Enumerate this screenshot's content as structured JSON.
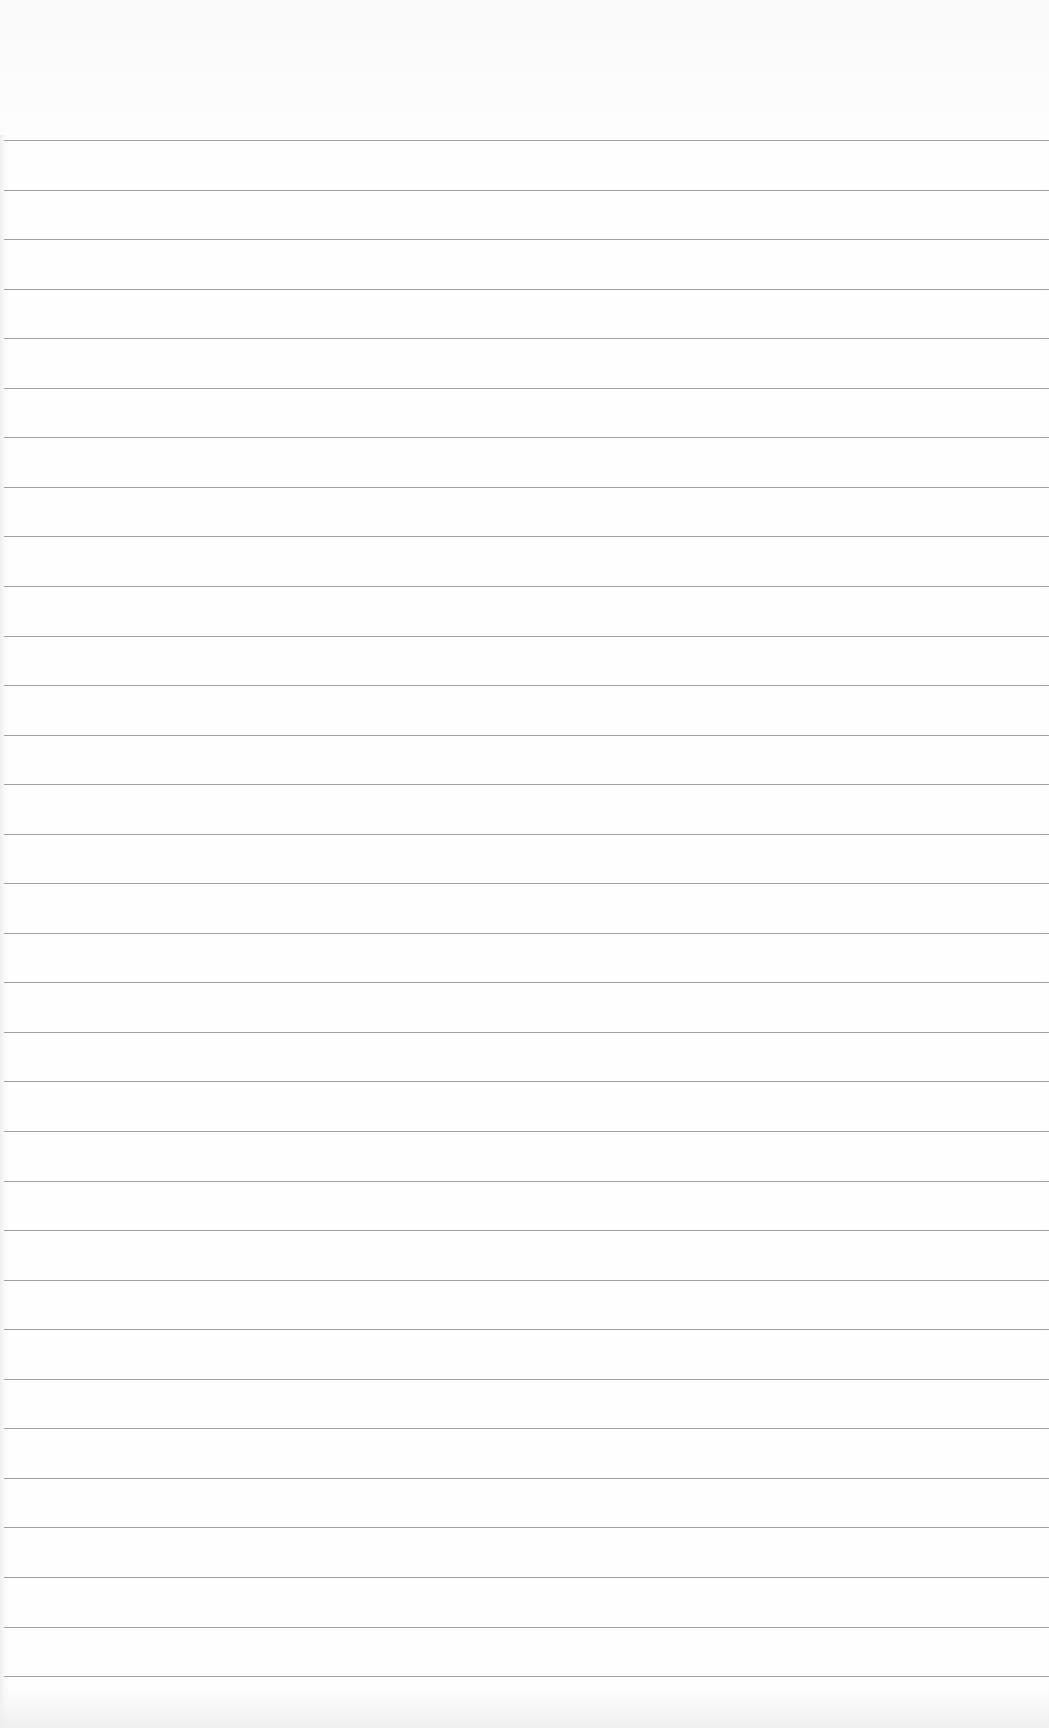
{
  "page": {
    "type": "lined-paper",
    "background_color": "#fefefe",
    "rule_color": "#8f8f8f",
    "rule_count": 32,
    "first_rule_y": 140,
    "rule_spacing": 49.55
  }
}
